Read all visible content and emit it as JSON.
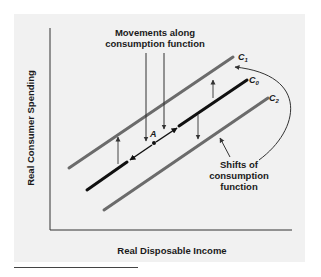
{
  "figure": {
    "y_axis_label": "Real Consumer Spending",
    "x_axis_label": "Real Disposable Income",
    "annotations": {
      "movements_line1": "Movements along",
      "movements_line2": "consumption function",
      "shifts_line1": "Shifts of",
      "shifts_line2": "consumption",
      "shifts_line3": "function",
      "point_label": "A"
    },
    "curves": [
      {
        "name": "C",
        "subscript": "1",
        "color": "#6b6b6b"
      },
      {
        "name": "C",
        "subscript": "0",
        "color": "#111111"
      },
      {
        "name": "C",
        "subscript": "2",
        "color": "#6b6b6b"
      }
    ],
    "colors": {
      "background": "#f1f1f1",
      "axis": "#333333",
      "shifted_line": "#6b6b6b",
      "base_line": "#111111"
    }
  }
}
